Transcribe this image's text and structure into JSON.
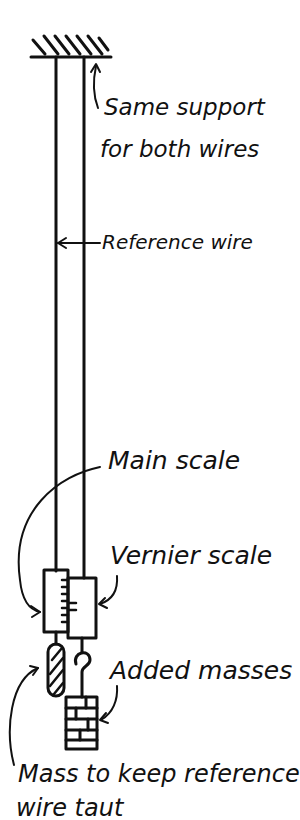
{
  "diagram": {
    "labels": {
      "support": [
        "Same support",
        "for both wires"
      ],
      "reference_wire": "Reference wire",
      "main_scale": "Main scale",
      "vernier_scale": "Vernier scale",
      "added_masses": "Added masses",
      "mass_taut": [
        "Mass to keep reference",
        "wire taut"
      ]
    },
    "colors": {
      "ink": "#111111",
      "background": "#ffffff"
    }
  }
}
